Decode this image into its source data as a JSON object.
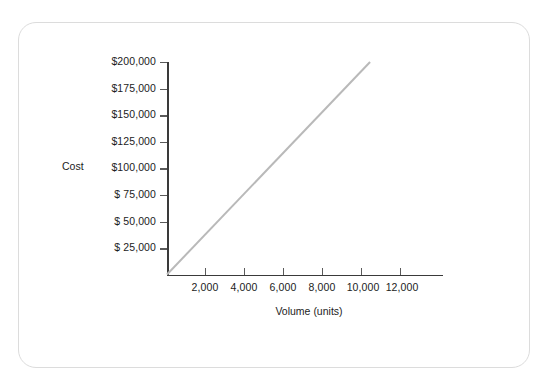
{
  "chart_data": {
    "type": "line",
    "title": "",
    "subtitle": "",
    "xlabel": "Volume (units)",
    "ylabel": "Cost",
    "xlim": [
      0,
      14000
    ],
    "ylim": [
      0,
      200000
    ],
    "grid": false,
    "legend": false,
    "x_ticks": [
      2000,
      4000,
      6000,
      8000,
      10000,
      12000
    ],
    "x_tick_labels": [
      "2,000",
      "4,000",
      "6,000",
      "8,000",
      "10,000",
      "12,000"
    ],
    "y_ticks": [
      25000,
      50000,
      75000,
      100000,
      125000,
      150000,
      175000,
      200000
    ],
    "y_tick_labels": [
      "$ 25,000",
      "$ 50,000",
      "$ 75,000",
      "$100,000",
      "$125,000",
      "$150,000",
      "$175,000",
      "$200,000"
    ],
    "series": [
      {
        "name": "Total variable cost",
        "color": "#b9b9b9",
        "linewidth": 2,
        "x": [
          0,
          10300
        ],
        "y": [
          0,
          200000
        ]
      }
    ],
    "annotations": []
  },
  "figure": {
    "border_color": "#dcdcdc",
    "background": "#ffffff",
    "axis_color": "#3a3a3a",
    "tick_label_color": "#1c1c1c"
  }
}
